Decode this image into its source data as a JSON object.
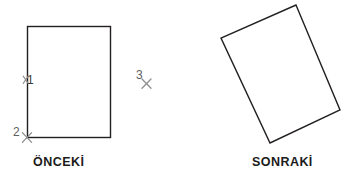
{
  "figure": {
    "background_color": "#ffffff",
    "outline_color": "#231f20",
    "marker_color": "#8a8a8a",
    "label_color": "#1b1b1b"
  },
  "before_panel": {
    "caption": "ÖNCEKİ",
    "shape_name": "rectangle",
    "rect": {
      "x": 27,
      "y": 26,
      "width": 83,
      "height": 111,
      "rotation_deg": 0
    },
    "markers": [
      {
        "id": "1",
        "label": "1",
        "glyph": "x",
        "x": 27,
        "y": 80
      },
      {
        "id": "2",
        "label": "2",
        "glyph": "x",
        "x": 27,
        "y": 137
      },
      {
        "id": "3",
        "label": "3",
        "glyph": "x",
        "x": 146,
        "y": 83
      }
    ]
  },
  "after_panel": {
    "caption": "SONRAKİ",
    "shape_name": "rotated-rectangle",
    "rotation_deg": 23,
    "corners": [
      {
        "x": 296,
        "y": 5
      },
      {
        "x": 340,
        "y": 110
      },
      {
        "x": 270,
        "y": 143
      },
      {
        "x": 221,
        "y": 38
      }
    ]
  }
}
